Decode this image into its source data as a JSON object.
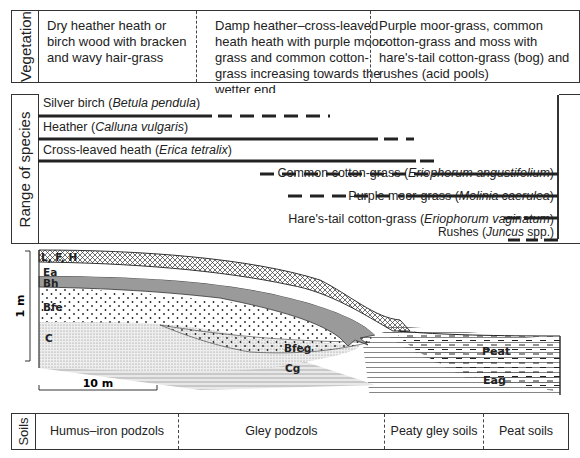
{
  "vegetation": {
    "label": "Vegetation",
    "zones": [
      "Dry heather heath or birch wood with bracken and wavy hair-grass",
      "Damp heather–cross-leaved heath heath with purple moor-grass and common cotton-grass increasing towards the wetter end",
      "Purple moor-grass, common cotton-grass and moss with hare's-tail cotton-grass (bog) and rushes (acid pools)"
    ]
  },
  "range_of_species": {
    "label": "Range of species",
    "species": [
      {
        "common": "Silver birch",
        "latin": "Betula pendula",
        "align": "left"
      },
      {
        "common": "Heather",
        "latin": "Calluna vulgaris",
        "align": "left"
      },
      {
        "common": "Cross-leaved heath",
        "latin": "Erica tetralix",
        "align": "left"
      },
      {
        "common": "Common cotton-grass",
        "latin": "Eriophorum angustifolium",
        "align": "right"
      },
      {
        "common": "Purple moor-grass",
        "latin": "Molinia caerulea",
        "align": "right"
      },
      {
        "common": "Hare's-tail cotton-grass",
        "latin": "Eriophorum vaginatum",
        "align": "right"
      },
      {
        "common": "Rushes",
        "latin": "Juncus",
        "suffix": " spp.",
        "align": "right"
      }
    ]
  },
  "profile": {
    "horizons": [
      "L, F, H",
      "Ea",
      "Bh",
      "Bfe",
      "C",
      "Bfeg",
      "Cg",
      "Peat",
      "Eag"
    ],
    "vertical_scale": "1 m",
    "horizontal_scale": "10 m"
  },
  "soils": {
    "label": "Soils",
    "zones": [
      "Humus–iron podzols",
      "Gley podzols",
      "Peaty gley soils",
      "Peat soils"
    ]
  }
}
